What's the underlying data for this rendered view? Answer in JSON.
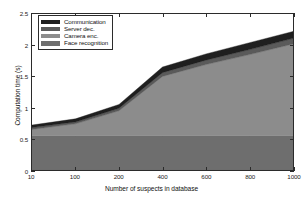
{
  "chart_data": {
    "type": "area",
    "stacked": true,
    "title": "",
    "xlabel": "Number of suspects in database",
    "ylabel": "Computation time (s)",
    "x": [
      10,
      100,
      200,
      400,
      600,
      800,
      1000
    ],
    "xtick_labels": [
      "10",
      "100",
      "200",
      "400",
      "600",
      "800",
      "1000"
    ],
    "ytick_labels": [
      "0",
      "0.5",
      "1",
      "1.5",
      "2",
      "2.5"
    ],
    "yticks": [
      0,
      0.5,
      1,
      1.5,
      2,
      2.5
    ],
    "ylim": [
      0,
      2.5
    ],
    "grid": false,
    "legend_position": "upper left",
    "series": [
      {
        "name": "Face recognition",
        "color": "#6e6e6e",
        "values": [
          0.55,
          0.55,
          0.55,
          0.55,
          0.55,
          0.55,
          0.55
        ]
      },
      {
        "name": "Camera enc.",
        "color": "#8c8c8c",
        "values": [
          0.1,
          0.19,
          0.4,
          0.95,
          1.14,
          1.3,
          1.47
        ]
      },
      {
        "name": "Server dec.",
        "color": "#5a5a5a",
        "values": [
          0.03,
          0.03,
          0.04,
          0.06,
          0.07,
          0.08,
          0.09
        ]
      },
      {
        "name": "Communication",
        "color": "#1f1f1f",
        "values": [
          0.04,
          0.05,
          0.06,
          0.09,
          0.1,
          0.11,
          0.11
        ]
      }
    ],
    "totals": [
      0.72,
      0.82,
      1.05,
      1.65,
      1.86,
      2.04,
      2.22
    ]
  },
  "legend": {
    "items": [
      {
        "label": "Communication",
        "color": "#1f1f1f"
      },
      {
        "label": "Server dec.",
        "color": "#5a5a5a"
      },
      {
        "label": "Camera enc.",
        "color": "#8c8c8c"
      },
      {
        "label": "Face recognition",
        "color": "#6e6e6e"
      }
    ]
  },
  "axes": {
    "x_title": "Number of suspects in database",
    "y_title": "Computation time (s)"
  }
}
